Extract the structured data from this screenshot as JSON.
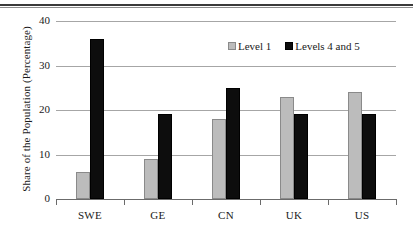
{
  "chart_data": {
    "type": "bar",
    "title": "",
    "xlabel": "",
    "ylabel": "Share of the Population (Percentage)",
    "categories": [
      "SWE",
      "GE",
      "CN",
      "UK",
      "US"
    ],
    "series": [
      {
        "name": "Level 1",
        "color": "#bcbcbc",
        "values": [
          6,
          9,
          18,
          23,
          24
        ]
      },
      {
        "name": "Levels 4 and 5",
        "color": "#0d0d0d",
        "values": [
          36,
          19,
          25,
          19,
          19
        ]
      }
    ],
    "ylim": [
      0,
      40
    ],
    "yticks": [
      0,
      10,
      20,
      30,
      40
    ],
    "ytick_labels": [
      "0",
      "10",
      "20",
      "30",
      "40"
    ],
    "grid": "horizontal",
    "legend_position": "top-right-inside"
  }
}
